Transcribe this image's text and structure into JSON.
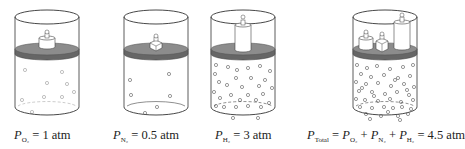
{
  "figure": {
    "colors": {
      "outline": "#333333",
      "piston": "#8c8c8c",
      "piston_edge": "#555555",
      "weight": "#ffffff",
      "molecule": "#555555"
    },
    "panels": [
      {
        "id": "oxygen",
        "gas": "O2",
        "symbol": "P",
        "subscript": "O₂",
        "equation_rest": " = 1 atm",
        "pressure_atm": 1,
        "molecule_count": 9,
        "weights": 1
      },
      {
        "id": "nitrogen",
        "gas": "N2",
        "symbol": "P",
        "subscript": "N₂",
        "equation_rest": " = 0.5 atm",
        "pressure_atm": 0.5,
        "molecule_count": 6,
        "weights": 1
      },
      {
        "id": "hydrogen",
        "gas": "H2",
        "symbol": "P",
        "subscript": "H₂",
        "equation_rest": " = 3 atm",
        "pressure_atm": 3,
        "molecule_count": 30,
        "weights": 1
      },
      {
        "id": "total",
        "gas": "mixture",
        "symbol": "P",
        "subscript": "Total",
        "terms": [
          {
            "symbol": "P",
            "subscript": "O₂"
          },
          {
            "symbol": "P",
            "subscript": "N₂"
          },
          {
            "symbol": "P",
            "subscript": "H₂"
          }
        ],
        "equals": " = ",
        "plus": " + ",
        "result": " = 4.5 atm",
        "pressure_atm": 4.5,
        "molecule_count": 45,
        "weights": 3
      }
    ]
  }
}
